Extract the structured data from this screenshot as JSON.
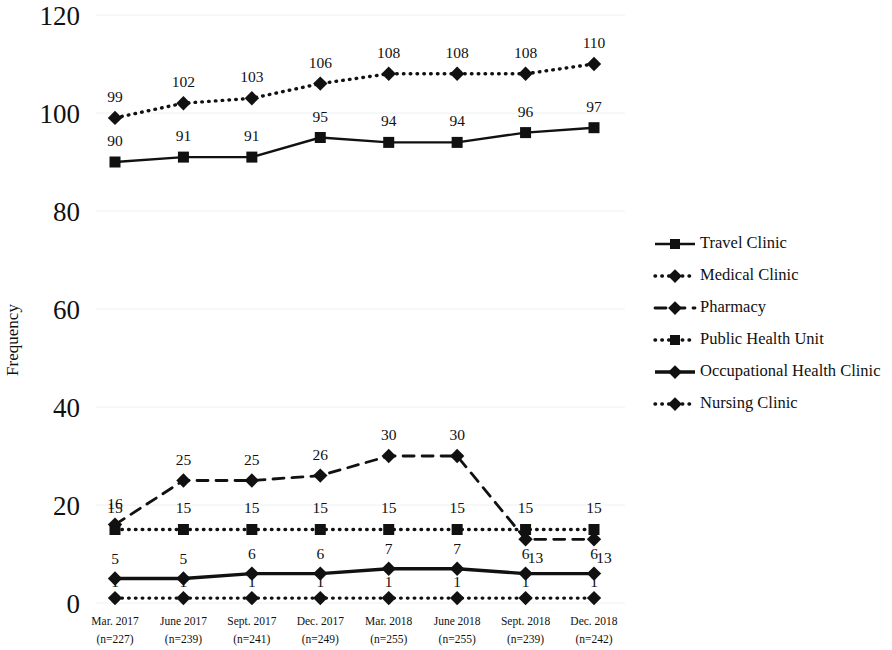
{
  "chart_data": {
    "type": "line",
    "title": "",
    "xlabel": "",
    "ylabel": "Frequency",
    "ylim": [
      0,
      120
    ],
    "yticks": [
      0,
      20,
      40,
      60,
      80,
      100,
      120
    ],
    "grid": true,
    "legend_position": "right",
    "categories": [
      "Mar. 2017",
      "June 2017",
      "Sept. 2017",
      "Dec. 2017",
      "Mar. 2018",
      "June 2018",
      "Sept. 2018",
      "Dec. 2018"
    ],
    "category_sublabels": [
      "(n=227)",
      "(n=239)",
      "(n=241)",
      "(n=249)",
      "(n=255)",
      "(n=255)",
      "(n=239)",
      "(n=242)"
    ],
    "series": [
      {
        "name": "Travel Clinic",
        "values": [
          90,
          91,
          91,
          95,
          94,
          94,
          96,
          97
        ],
        "line_style": "solid",
        "marker": "square",
        "color": "#111111",
        "label_offset": "below"
      },
      {
        "name": "Medical Clinic",
        "values": [
          99,
          102,
          103,
          106,
          108,
          108,
          108,
          110
        ],
        "line_style": "dotted",
        "marker": "diamond",
        "color": "#111111",
        "label_offset": "above"
      },
      {
        "name": "Pharmacy",
        "values": [
          16,
          25,
          25,
          26,
          30,
          30,
          13,
          13
        ],
        "line_style": "dashed",
        "marker": "diamond",
        "color": "#111111",
        "label_offset": "above"
      },
      {
        "name": "Public Health Unit",
        "values": [
          15,
          15,
          15,
          15,
          15,
          15,
          15,
          15
        ],
        "line_style": "dotted",
        "marker": "square",
        "color": "#111111",
        "label_offset": "above"
      },
      {
        "name": "Occupational Health Clinic",
        "values": [
          5,
          5,
          6,
          6,
          7,
          7,
          6,
          6
        ],
        "line_style": "solid-thick",
        "marker": "diamond",
        "color": "#111111",
        "label_offset": "above"
      },
      {
        "name": "Nursing Clinic",
        "values": [
          1,
          1,
          1,
          1,
          1,
          1,
          1,
          1
        ],
        "line_style": "dotted",
        "marker": "diamond",
        "color": "#111111",
        "label_offset": "above"
      }
    ],
    "annotations": {
      "pharmacy_first_label": "16",
      "note": "Pharmacy first point label 16 sits above Public Health Unit marker; Pharmacy last two labels 13 are drawn below the overlapping Public Health Unit 15 markers."
    }
  },
  "axis": {
    "y_title": "Frequency",
    "y_tick_labels": [
      "120",
      "100",
      "80",
      "60",
      "40",
      "20",
      "0"
    ]
  },
  "legend": {
    "entries": [
      {
        "label": "Travel Clinic"
      },
      {
        "label": "Medical Clinic"
      },
      {
        "label": "Pharmacy"
      },
      {
        "label": "Public Health Unit"
      },
      {
        "label": "Occupational Health Clinic"
      },
      {
        "label": "Nursing Clinic"
      }
    ]
  }
}
